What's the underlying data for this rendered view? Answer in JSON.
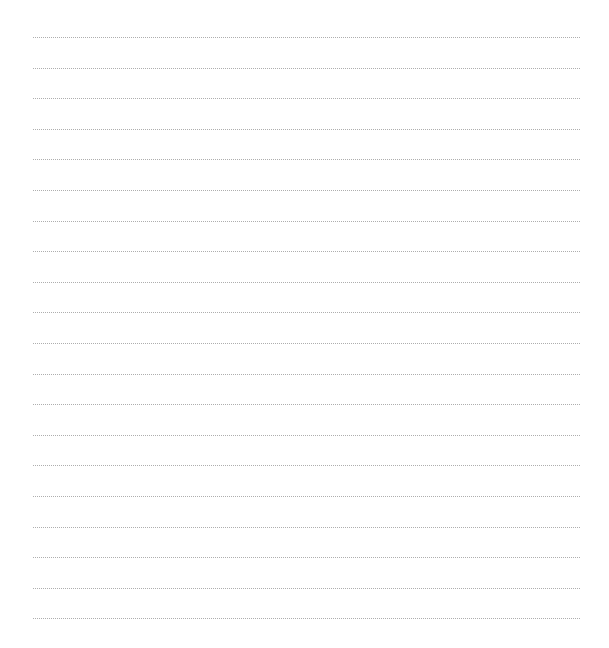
{
  "page": {
    "type": "lined-paper",
    "line_count": 20,
    "first_line_y": 37,
    "line_spacing": 30.6,
    "line_left": 33,
    "line_right": 580,
    "line_color": "#9a9a9a",
    "line_style": "dotted",
    "background": "#ffffff"
  }
}
